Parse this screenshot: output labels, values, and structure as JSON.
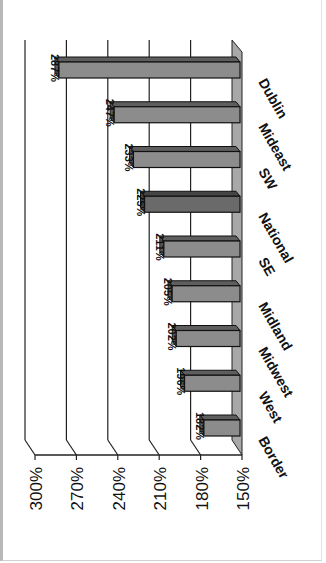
{
  "chart_data": {
    "type": "bar",
    "orientation": "rotated-90-clockwise 3D column chart",
    "title": "",
    "xlabel": "",
    "ylabel": "",
    "categories": [
      "Border",
      "West",
      "Midwest",
      "Midland",
      "SE",
      "National",
      "SW",
      "Mideast",
      "Dublin"
    ],
    "values": [
      182,
      196,
      202,
      205,
      211,
      225,
      233,
      247,
      287
    ],
    "value_labels": [
      "182%",
      "196%",
      "202%",
      "205%",
      "211%",
      "225%",
      "233%",
      "247%",
      "287%"
    ],
    "highlighted_category": "National",
    "ylim": [
      150,
      300
    ],
    "y_ticks": [
      "150%",
      "180%",
      "210%",
      "240%",
      "270%",
      "300%"
    ],
    "grid": true,
    "legend": null
  },
  "colors": {
    "bar": "#8c8c8c",
    "bar_top": "#5e5e5e",
    "bar_highlight": "#6a6a6a",
    "bar_highlight_top": "#454545",
    "floor": "#a8a8a8",
    "grid": "#222222",
    "text": "#111111"
  }
}
